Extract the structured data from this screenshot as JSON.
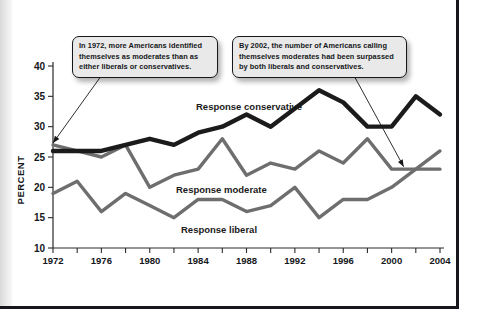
{
  "figure": {
    "axis_title_y": "PERCENT",
    "series_labels": {
      "conservative": "Response conservative",
      "moderate": "Response moderate",
      "liberal": "Response liberal"
    },
    "annotations": {
      "callout_1": "In 1972, more Americans identified themselves as moderates than as either liberals or conservatives.",
      "callout_2": "By 2002, the number of Americans calling themselves moderates had been surpassed by both liberals and conservatives."
    },
    "colors": {
      "conservative": "#1b1b1b",
      "moderate": "#6e6e6e",
      "liberal": "#6e6e6e",
      "axis": "#2a2a2a",
      "callout_fill": "#e9e9e9",
      "callout_border": "#15171a",
      "page_edge": "#15171a"
    }
  },
  "chart_data": {
    "type": "line",
    "title": "",
    "xlabel": "",
    "ylabel": "PERCENT",
    "xlim": [
      1972,
      2004
    ],
    "ylim": [
      10,
      40
    ],
    "grid": false,
    "legend_position": "inline-on-plot",
    "x": [
      1972,
      1974,
      1976,
      1978,
      1980,
      1982,
      1984,
      1986,
      1988,
      1990,
      1992,
      1994,
      1996,
      1998,
      2000,
      2002,
      2004
    ],
    "xticks_labeled": [
      1972,
      1976,
      1980,
      1984,
      1988,
      1992,
      1996,
      2000,
      2004
    ],
    "xtick_step_minor": 2,
    "yticks": [
      10,
      15,
      20,
      25,
      30,
      35,
      40
    ],
    "series": [
      {
        "name": "Response conservative",
        "color": "#1b1b1b",
        "values": [
          26,
          26,
          26,
          27,
          28,
          27,
          29,
          30,
          32,
          30,
          33,
          36,
          34,
          30,
          30,
          35,
          32
        ]
      },
      {
        "name": "Response moderate",
        "color": "#6e6e6e",
        "values": [
          27,
          26,
          25,
          27,
          20,
          22,
          23,
          28,
          22,
          24,
          23,
          26,
          24,
          28,
          23,
          23,
          23
        ]
      },
      {
        "name": "Response liberal",
        "color": "#6e6e6e",
        "values": [
          19,
          21,
          16,
          19,
          17,
          15,
          18,
          18,
          16,
          17,
          20,
          15,
          18,
          18,
          20,
          23,
          26
        ]
      }
    ],
    "annotations": [
      {
        "text": "In 1972, more Americans identified themselves as moderates than as either liberals or conservatives.",
        "points_to_year": 1972,
        "points_to_value": 27.3
      },
      {
        "text": "By 2002, the number of Americans calling themselves moderates had been surpassed by both liberals and conservatives.",
        "points_to_year": 2001,
        "points_to_value": 23.4
      }
    ]
  }
}
